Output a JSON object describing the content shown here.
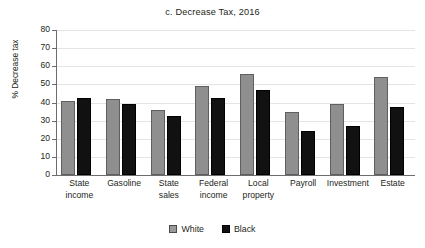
{
  "chart_data": {
    "type": "bar",
    "title": "c. Decrease Tax, 2016",
    "xlabel": "",
    "ylabel": "% Decrease tax",
    "ylim": [
      0,
      80
    ],
    "ytick_step": 10,
    "yticks": [
      "80",
      "70",
      "60",
      "50",
      "40",
      "30",
      "20",
      "10",
      "0"
    ],
    "grid": true,
    "legend_position": "bottom-center",
    "categories": [
      "State income",
      "Gasoline",
      "State sales",
      "Federal income",
      "Local property",
      "Payroll",
      "Investment",
      "Estate"
    ],
    "category_lines": [
      [
        "State",
        "income"
      ],
      [
        "Gasoline",
        ""
      ],
      [
        "State",
        "sales"
      ],
      [
        "Federal",
        "income"
      ],
      [
        "Local",
        "property"
      ],
      [
        "Payroll",
        ""
      ],
      [
        "Investment",
        ""
      ],
      [
        "Estate",
        ""
      ]
    ],
    "series": [
      {
        "name": "White",
        "color": "#8f8f8f",
        "values": [
          41.0,
          41.7,
          36.0,
          49.3,
          55.6,
          34.5,
          39.2,
          54.0
        ]
      },
      {
        "name": "Black",
        "color": "#111111",
        "values": [
          42.3,
          39.3,
          32.3,
          42.7,
          46.8,
          24.4,
          27.3,
          37.7
        ]
      }
    ]
  },
  "legend": {
    "items": [
      {
        "label": "White",
        "swatch": "white"
      },
      {
        "label": "Black",
        "swatch": "black"
      }
    ]
  },
  "colors": {
    "white_bar": "#8f8f8f",
    "black_bar": "#111111",
    "gridline": "#e4e4e4",
    "axis": "#6d6d6d",
    "text": "#231f20",
    "background": "#ffffff"
  }
}
